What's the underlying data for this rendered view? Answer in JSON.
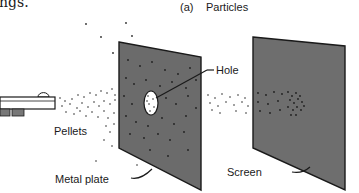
{
  "figure": {
    "cropped_caption_fragment": "ngs.",
    "panel_label": "(a)",
    "title": "Particles",
    "labels": {
      "hole": "Hole",
      "pellets": "Pellets",
      "metal_plate": "Metal plate",
      "screen": "Screen"
    },
    "colors": {
      "plate_fill": "#6b6b6b",
      "screen_fill": "#6e6e6e",
      "outline": "#1a1a1a",
      "pellet": "#2a2a2a",
      "background": "#ffffff"
    }
  }
}
